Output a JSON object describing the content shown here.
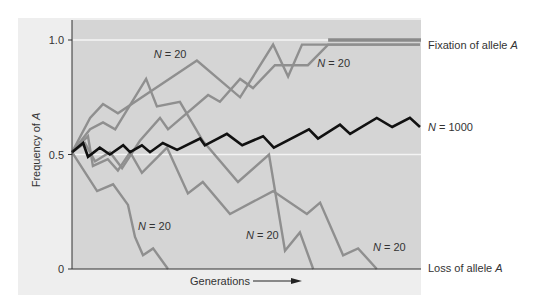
{
  "chart_data": {
    "type": "line",
    "title": "",
    "xlabel": "Generations",
    "ylabel": "Frequency of A",
    "ylabel_italic_part": "A",
    "ylim": [
      0,
      1.0
    ],
    "xlim": [
      0,
      100
    ],
    "yticks": [
      {
        "value": 0,
        "label": "0"
      },
      {
        "value": 0.5,
        "label": "0.5"
      },
      {
        "value": 1.0,
        "label": "1.0"
      }
    ],
    "gridlines": [
      0.5,
      1.0
    ],
    "x_arrow": true,
    "annotations": {
      "fixation": {
        "text": "Fixation of allele ",
        "italic": "A",
        "value": 1.0
      },
      "loss": {
        "text": "Loss of allele ",
        "italic": "A",
        "value": 0
      },
      "n1000": {
        "text": "= 1000",
        "italic": "N",
        "value": 0.62
      }
    },
    "n_labels": [
      {
        "italic": "N",
        "text": " = 20",
        "x": 23.5,
        "y": 0.92
      },
      {
        "italic": "N",
        "text": " = 20",
        "x": 70.5,
        "y": 0.88
      },
      {
        "italic": "N",
        "text": " = 20",
        "x": 19.0,
        "y": 0.17
      },
      {
        "italic": "N",
        "text": " = 20",
        "x": 50.0,
        "y": 0.13
      },
      {
        "italic": "N",
        "text": " = 20",
        "x": 86.5,
        "y": 0.08
      }
    ],
    "series": [
      {
        "name": "N = 20 (fixed, run 1)",
        "style": "gray",
        "points": [
          [
            0,
            0.51
          ],
          [
            5.2,
            0.66
          ],
          [
            8.9,
            0.72
          ],
          [
            13.2,
            0.68
          ],
          [
            35.9,
            0.91
          ],
          [
            48.3,
            0.75
          ],
          [
            57.8,
            0.98
          ],
          [
            62.1,
            0.84
          ],
          [
            66.1,
            0.98
          ],
          [
            100,
            0.98
          ]
        ]
      },
      {
        "name": "N = 20 (fixed, run 2)",
        "style": "gray",
        "points": [
          [
            0,
            0.51
          ],
          [
            3.7,
            0.55
          ],
          [
            6.6,
            0.47
          ],
          [
            10.9,
            0.51
          ],
          [
            14.4,
            0.44
          ],
          [
            19.5,
            0.56
          ],
          [
            25.3,
            0.66
          ],
          [
            27.6,
            0.61
          ],
          [
            39.1,
            0.76
          ],
          [
            42.5,
            0.73
          ],
          [
            48.3,
            0.83
          ],
          [
            52.0,
            0.79
          ],
          [
            58.3,
            0.89
          ],
          [
            67.8,
            0.89
          ],
          [
            73.6,
            0.98
          ],
          [
            100,
            0.98
          ]
        ]
      },
      {
        "name": "N = 20 (lost, run 1)",
        "style": "gray",
        "points": [
          [
            0,
            0.51
          ],
          [
            5.2,
            0.61
          ],
          [
            8.9,
            0.64
          ],
          [
            12.4,
            0.61
          ],
          [
            21.3,
            0.83
          ],
          [
            24.4,
            0.71
          ],
          [
            31.0,
            0.73
          ],
          [
            37.6,
            0.56
          ],
          [
            47.7,
            0.38
          ],
          [
            56.6,
            0.5
          ],
          [
            61.2,
            0.08
          ],
          [
            65.5,
            0.16
          ],
          [
            69.3,
            0
          ]
        ]
      },
      {
        "name": "N = 20 (lost, run 2)",
        "style": "gray",
        "points": [
          [
            0,
            0.51
          ],
          [
            4.6,
            0.58
          ],
          [
            6.0,
            0.45
          ],
          [
            10.3,
            0.48
          ],
          [
            13.2,
            0.43
          ],
          [
            16.7,
            0.51
          ],
          [
            20.1,
            0.42
          ],
          [
            27.3,
            0.53
          ],
          [
            33.3,
            0.33
          ],
          [
            37.6,
            0.38
          ],
          [
            45.4,
            0.24
          ],
          [
            57.8,
            0.34
          ],
          [
            67.5,
            0.24
          ],
          [
            71.3,
            0.29
          ],
          [
            77.9,
            0.06
          ],
          [
            82.2,
            0.09
          ],
          [
            87.6,
            0
          ]
        ]
      },
      {
        "name": "N = 20 (lost, run 3)",
        "style": "gray",
        "points": [
          [
            0,
            0.51
          ],
          [
            7.2,
            0.34
          ],
          [
            11.8,
            0.37
          ],
          [
            16.1,
            0.28
          ],
          [
            18.1,
            0.14
          ],
          [
            20.4,
            0.06
          ],
          [
            23.3,
            0.09
          ],
          [
            27.6,
            0
          ]
        ]
      },
      {
        "name": "N = 1000",
        "style": "black",
        "points": [
          [
            0,
            0.51
          ],
          [
            3.2,
            0.55
          ],
          [
            4.6,
            0.49
          ],
          [
            8.0,
            0.53
          ],
          [
            10.9,
            0.5
          ],
          [
            14.7,
            0.54
          ],
          [
            16.7,
            0.51
          ],
          [
            20.1,
            0.54
          ],
          [
            22.4,
            0.51
          ],
          [
            26.1,
            0.55
          ],
          [
            30.2,
            0.52
          ],
          [
            36.8,
            0.57
          ],
          [
            38.2,
            0.54
          ],
          [
            44.5,
            0.59
          ],
          [
            48.9,
            0.54
          ],
          [
            54.9,
            0.58
          ],
          [
            58.0,
            0.53
          ],
          [
            68.1,
            0.61
          ],
          [
            70.7,
            0.57
          ],
          [
            77.0,
            0.63
          ],
          [
            79.9,
            0.59
          ],
          [
            87.6,
            0.66
          ],
          [
            92.0,
            0.62
          ],
          [
            97.1,
            0.66
          ],
          [
            100,
            0.62
          ]
        ]
      }
    ],
    "colors": {
      "outer_panel": "#eeeeee",
      "plot_area": "#d5d5d5",
      "gridline": "#f4f4f4",
      "gray_series": "#8f8f8f",
      "black_series": "#111111",
      "axis": "#333333",
      "fixation_bar": "#8a8a8a"
    }
  }
}
